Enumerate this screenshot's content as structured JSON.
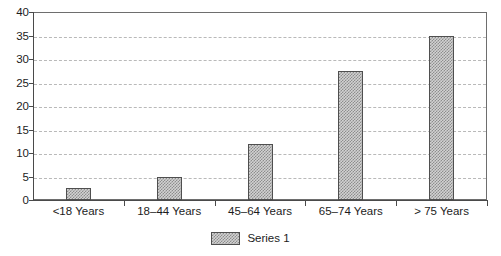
{
  "chart_data": {
    "type": "bar",
    "title": "",
    "subtitle": "",
    "xlabel": "",
    "ylabel": "",
    "categories": [
      "<18 Years",
      "18–44 Years",
      "45–64 Years",
      "65–74 Years",
      "> 75 Years"
    ],
    "series": [
      {
        "name": "Series 1",
        "values": [
          2.6,
          5,
          12,
          27.5,
          35
        ]
      }
    ],
    "ylim": [
      0,
      40
    ],
    "ytick_step": 5,
    "yticks": [
      "0",
      "5",
      "10",
      "15",
      "20",
      "25",
      "30",
      "35",
      "40"
    ],
    "grid": true,
    "grid_axis": "y",
    "grid_style": "dashed",
    "legend": {
      "position": "bottom-center",
      "entries": [
        {
          "label": "Series 1",
          "swatch": "hatched-gray-swatch"
        }
      ]
    },
    "colors": {
      "bar_fill": "#d2d2d2",
      "bar_pattern": "#8d8d8d",
      "bar_border": "#4f4f4f",
      "axis": "#4a4a4a",
      "grid": "#b9b9b9",
      "frame": "#6e6e6e",
      "text": "#1c1c1c",
      "background": "#ffffff"
    }
  }
}
